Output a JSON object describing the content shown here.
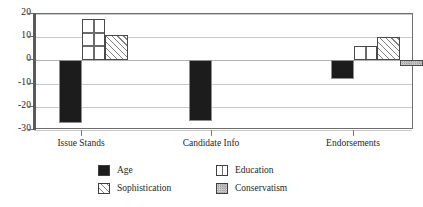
{
  "chart_data": {
    "type": "bar",
    "title": "",
    "subtitle": "",
    "xlabel": "",
    "ylabel": "",
    "categories": [
      "Issue Stands",
      "Candidate Info",
      "Endorsements"
    ],
    "ylim": [
      -30,
      20
    ],
    "yticks": [
      20,
      10,
      0,
      -10,
      -20,
      -30
    ],
    "ytick_labels": [
      "20",
      "10",
      "0",
      "-10",
      "-20",
      "-30"
    ],
    "grid": true,
    "legend_position": "below-center",
    "zero_reference_line": 0,
    "series": [
      {
        "name": "Age",
        "fill": "solid-black",
        "color": "#1c1c1c",
        "values": [
          -27,
          -26,
          -8
        ]
      },
      {
        "name": "Sophistication",
        "fill": "diagonal-hatch",
        "color": "#808080",
        "values": [
          11,
          0,
          10
        ]
      },
      {
        "name": "Education",
        "fill": "grid-cross-hatch",
        "color": "#6b6b6b",
        "values": [
          18,
          0,
          6
        ]
      },
      {
        "name": "Conservatism",
        "fill": "stipple-dot",
        "color": "#9a9a9a",
        "values": [
          0,
          0,
          -2.5
        ]
      }
    ],
    "legend_order": [
      "Age",
      "Education",
      "Sophistication",
      "Conservatism"
    ]
  }
}
